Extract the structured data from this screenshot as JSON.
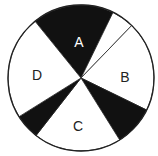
{
  "diagram": {
    "type": "spinner",
    "center": [
      81,
      78
    ],
    "radius": 73,
    "colors": {
      "fill_dark": "#111111",
      "fill_light": "#ffffff",
      "stroke": "#222222",
      "label_on_dark": "#ffffff",
      "label_on_light": "#222222"
    },
    "sectors": [
      {
        "name": "A",
        "label": "A",
        "start_deg": 231,
        "end_deg": 296,
        "shaded": true
      },
      {
        "name": "gap-AB",
        "label": "",
        "start_deg": 296,
        "end_deg": 314,
        "shaded": false
      },
      {
        "name": "B",
        "label": "B",
        "start_deg": 314,
        "end_deg": 386,
        "shaded": false
      },
      {
        "name": "dark-BC",
        "label": "",
        "start_deg": 26,
        "end_deg": 58,
        "shaded": true
      },
      {
        "name": "C",
        "label": "C",
        "start_deg": 58,
        "end_deg": 128,
        "shaded": false
      },
      {
        "name": "dark-CD",
        "label": "",
        "start_deg": 128,
        "end_deg": 148,
        "shaded": true
      },
      {
        "name": "D",
        "label": "D",
        "start_deg": 148,
        "end_deg": 231,
        "shaded": false
      }
    ],
    "labels": {
      "A": {
        "text": "A",
        "x": 79,
        "y": 43
      },
      "B": {
        "text": "B",
        "x": 125,
        "y": 78
      },
      "C": {
        "text": "C",
        "x": 78,
        "y": 127
      },
      "D": {
        "text": "D",
        "x": 37,
        "y": 76
      }
    }
  }
}
